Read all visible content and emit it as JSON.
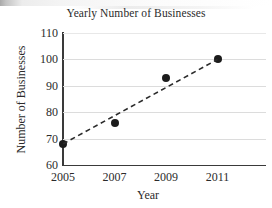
{
  "chart_data": {
    "type": "scatter",
    "title": "Yearly Number of Businesses",
    "xlabel": "Year",
    "ylabel": "Number of Businesses",
    "x": [
      2005,
      2007,
      2009,
      2011
    ],
    "values": [
      68,
      76,
      93,
      100
    ],
    "series": [
      {
        "name": "Number of Businesses",
        "values": [
          68,
          76,
          93,
          100
        ],
        "marker": "filled-circle",
        "color": "#1c1c1c"
      },
      {
        "name": "trend-line",
        "style": "dashed",
        "color": "#2b2b2b",
        "endpoints": [
          [
            2005,
            68
          ],
          [
            2011,
            100
          ]
        ]
      }
    ],
    "xlim": [
      2005,
      2011.6
    ],
    "ylim": [
      60,
      110
    ],
    "xticks": [
      2005,
      2007,
      2009,
      2011
    ],
    "yticks": [
      60,
      70,
      80,
      90,
      100,
      110
    ],
    "xtick_labels": [
      "2005",
      "2007",
      "2009",
      "2011"
    ],
    "ytick_labels": [
      "60",
      "70",
      "80",
      "90",
      "100",
      "110"
    ],
    "grid": "horizontal",
    "grid_color": "#dcdcdc",
    "legend": "none",
    "axis_color": "#3a3a3a",
    "background": "#ffffff"
  }
}
